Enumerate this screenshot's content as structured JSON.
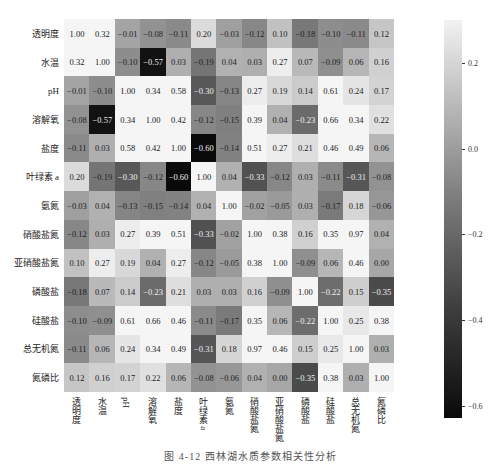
{
  "chart_data": {
    "type": "heatmap",
    "title": "",
    "caption": "图 4-12 西林湖水质参数相关性分析",
    "labels": [
      "透明度",
      "水温",
      "pH",
      "溶解氧",
      "盐度",
      "叶绿素 a",
      "氨氮",
      "硝酸盐氮",
      "亚硝酸盐氮",
      "磷酸盐",
      "硅酸盐",
      "总无机氮",
      "氮磷比"
    ],
    "matrix": [
      [
        1.0,
        0.32,
        -0.01,
        -0.08,
        -0.11,
        0.2,
        -0.03,
        -0.12,
        0.1,
        -0.18,
        -0.1,
        -0.11,
        0.12
      ],
      [
        0.32,
        1.0,
        -0.1,
        -0.57,
        0.03,
        -0.19,
        0.04,
        0.03,
        0.27,
        0.07,
        -0.09,
        0.06,
        0.16
      ],
      [
        -0.01,
        -0.1,
        1.0,
        0.34,
        0.58,
        -0.3,
        -0.13,
        0.27,
        0.19,
        0.14,
        0.61,
        0.24,
        0.17
      ],
      [
        -0.08,
        -0.57,
        0.34,
        1.0,
        0.42,
        -0.12,
        -0.15,
        0.39,
        0.04,
        -0.23,
        0.66,
        0.34,
        0.22
      ],
      [
        -0.11,
        0.03,
        0.58,
        0.42,
        1.0,
        -0.6,
        -0.14,
        0.51,
        0.27,
        0.21,
        0.46,
        0.49,
        0.06
      ],
      [
        0.2,
        -0.19,
        -0.3,
        -0.12,
        -0.6,
        1.0,
        0.04,
        -0.33,
        -0.12,
        0.03,
        -0.11,
        -0.31,
        -0.08
      ],
      [
        -0.03,
        0.04,
        -0.13,
        -0.15,
        -0.14,
        0.04,
        1.0,
        -0.02,
        -0.05,
        0.03,
        -0.17,
        0.18,
        -0.06
      ],
      [
        -0.12,
        0.03,
        0.27,
        0.39,
        0.51,
        -0.33,
        -0.02,
        1.0,
        0.38,
        0.16,
        0.35,
        0.97,
        0.04
      ],
      [
        0.1,
        0.27,
        0.19,
        0.04,
        0.27,
        -0.12,
        -0.05,
        0.38,
        1.0,
        -0.09,
        0.06,
        0.46,
        -0.0
      ],
      [
        -0.18,
        0.07,
        0.14,
        -0.23,
        0.21,
        0.03,
        0.03,
        0.16,
        -0.09,
        1.0,
        -0.22,
        0.15,
        -0.35
      ],
      [
        -0.1,
        -0.09,
        0.61,
        0.66,
        0.46,
        -0.11,
        -0.17,
        0.35,
        0.06,
        -0.22,
        1.0,
        0.25,
        0.38
      ],
      [
        -0.11,
        0.06,
        0.24,
        0.34,
        0.49,
        -0.31,
        0.18,
        0.97,
        0.46,
        0.15,
        0.25,
        1.0,
        0.03
      ],
      [
        0.12,
        0.16,
        0.17,
        0.22,
        0.06,
        -0.08,
        -0.06,
        0.04,
        -0.0,
        -0.35,
        0.38,
        0.03,
        1.0
      ]
    ],
    "colorbar": {
      "ticks": [
        "0.2",
        "0.0",
        "-0.2",
        "-0.4",
        "-0.6"
      ],
      "range": [
        -0.6,
        0.3
      ],
      "colormap": "grayscale (black = low, white = high)"
    }
  }
}
